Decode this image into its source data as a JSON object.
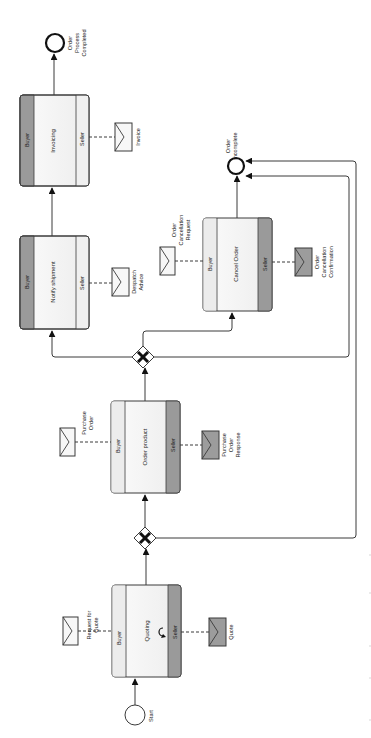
{
  "diagram": {
    "orientation": "rotated-90-ccw",
    "colors": {
      "stroke": "#3a3a3a",
      "task_fill": "#f4f4f4",
      "initiator_band": "#ececec",
      "responder_band": "#9a9a9a",
      "msg_light": "#f7f7f7",
      "msg_dark": "#9c9c9c"
    },
    "events": {
      "start": {
        "label": "Start",
        "cx": 135,
        "cy": 715,
        "r": 10
      },
      "end_completed": {
        "label_lines": [
          "Order",
          "Process",
          "Completed"
        ],
        "cx": 55,
        "cy": 43,
        "r": 9
      },
      "end_incomplete": {
        "label_lines": [
          "Order",
          "incomplete"
        ],
        "cx": 236,
        "cy": 166,
        "r": 8
      }
    },
    "gateways": [
      {
        "name": "gateway-after-quoting",
        "type": "exclusive",
        "cx": 145,
        "cy": 538
      },
      {
        "name": "gateway-after-order",
        "type": "exclusive",
        "cx": 143,
        "cy": 357
      }
    ],
    "tasks": [
      {
        "id": "quoting",
        "label": "Quoting",
        "x": 112,
        "y": 585,
        "w": 69,
        "h": 92,
        "buyer_label": "Buyer",
        "seller_label": "Seller",
        "dark_band": "seller",
        "loop": true
      },
      {
        "id": "order-product",
        "label": "Order product",
        "x": 111,
        "y": 401,
        "w": 69,
        "h": 92,
        "buyer_label": "Buyer",
        "seller_label": "Seller",
        "dark_band": "seller",
        "loop": false
      },
      {
        "id": "notify-shipment",
        "label": "Notify shipment",
        "x": 20,
        "y": 236,
        "w": 69,
        "h": 93,
        "buyer_label": "Buyer",
        "seller_label": "Seller",
        "dark_band": "buyer",
        "loop": false
      },
      {
        "id": "invoicing",
        "label": "Invoicing",
        "x": 20,
        "y": 95,
        "w": 69,
        "h": 91,
        "buyer_label": "Buyer",
        "seller_label": "Seller",
        "dark_band": "buyer",
        "loop": false
      },
      {
        "id": "cancel-order",
        "label": "Cancel Order",
        "x": 203,
        "y": 218,
        "w": 69,
        "h": 93,
        "buyer_label": "Buyer",
        "seller_label": "Seller",
        "dark_band": "seller",
        "loop": false
      }
    ],
    "messages": [
      {
        "id": "request-for-quote",
        "label_lines": [
          "Request for",
          "Quote"
        ],
        "side": "buyer",
        "shade": "light",
        "x": 63,
        "y": 617
      },
      {
        "id": "quote",
        "label_lines": [
          "Quote"
        ],
        "side": "seller",
        "shade": "dark",
        "x": 209,
        "y": 618
      },
      {
        "id": "purchase-order",
        "label_lines": [
          "Purchase",
          "Order"
        ],
        "side": "buyer",
        "shade": "light",
        "x": 60,
        "y": 428
      },
      {
        "id": "purchase-order-response",
        "label_lines": [
          "Purchase",
          "Order",
          "Response"
        ],
        "side": "seller",
        "shade": "dark",
        "x": 202,
        "y": 431
      },
      {
        "id": "despatch-advice",
        "label_lines": [
          "Despatch",
          "Advice"
        ],
        "side": "seller",
        "shade": "light",
        "x": 112,
        "y": 268
      },
      {
        "id": "invoice",
        "label_lines": [
          "Invoice"
        ],
        "side": "seller",
        "shade": "light",
        "x": 115,
        "y": 123
      },
      {
        "id": "order-cancellation-request",
        "label_lines": [
          "Order",
          "Cancellation",
          "Request"
        ],
        "side": "buyer",
        "shade": "light",
        "x": 160,
        "y": 247
      },
      {
        "id": "order-cancellation-confirmation",
        "label_lines": [
          "Order",
          "Cancellation",
          "Confirmation"
        ],
        "side": "seller",
        "shade": "dark",
        "x": 295,
        "y": 248
      }
    ]
  }
}
